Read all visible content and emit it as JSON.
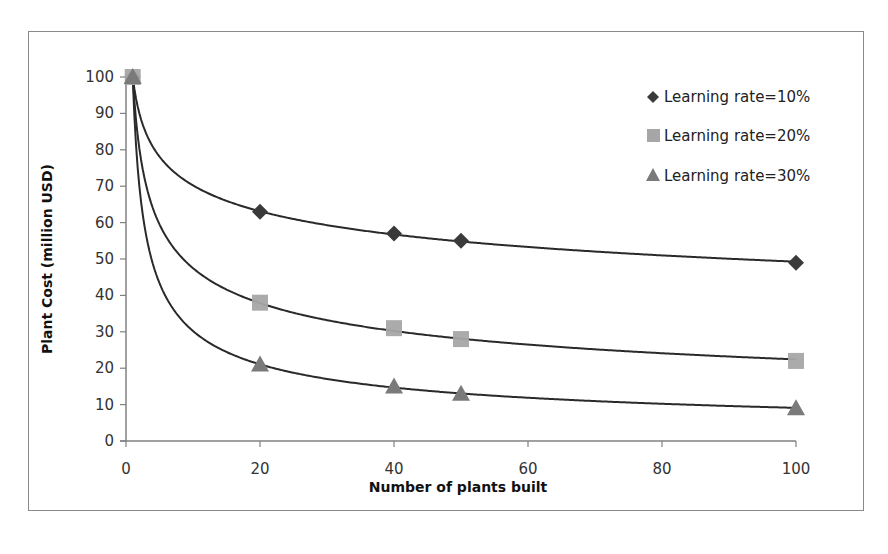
{
  "chart_data": {
    "type": "scatter",
    "title": "",
    "xlabel": "Number of plants built",
    "ylabel": "Plant Cost (million USD)",
    "xlim": [
      0,
      100
    ],
    "ylim": [
      0,
      100
    ],
    "xticks": [
      0,
      20,
      40,
      60,
      80,
      100
    ],
    "yticks": [
      0,
      10,
      20,
      30,
      40,
      50,
      60,
      70,
      80,
      90,
      100
    ],
    "grid": false,
    "legend_position": "upper right",
    "series": [
      {
        "name": "Learning rate=10%",
        "marker": "diamond",
        "color": "#3a3a3a",
        "trendline": "power",
        "x": [
          1,
          20,
          40,
          50,
          100
        ],
        "y": [
          100,
          63,
          57,
          55,
          49
        ]
      },
      {
        "name": "Learning rate=20%",
        "marker": "square",
        "color": "#a6a6a6",
        "trendline": "power",
        "x": [
          1,
          20,
          40,
          50,
          100
        ],
        "y": [
          100,
          38,
          31,
          28,
          22
        ]
      },
      {
        "name": "Learning rate=30%",
        "marker": "triangle",
        "color": "#7a7a7a",
        "trendline": "power",
        "x": [
          1,
          20,
          40,
          50,
          100
        ],
        "y": [
          100,
          21,
          15,
          13,
          9
        ]
      }
    ]
  },
  "axes": {
    "x_title": "Number of plants built",
    "y_title": "Plant Cost (million USD)",
    "x_tick_labels": [
      "0",
      "20",
      "40",
      "60",
      "80",
      "100"
    ],
    "y_tick_labels": [
      "0",
      "10",
      "20",
      "30",
      "40",
      "50",
      "60",
      "70",
      "80",
      "90",
      "100"
    ]
  },
  "legend": {
    "items": [
      {
        "label": "Learning rate=10%",
        "icon": "diamond-icon"
      },
      {
        "label": "Learning rate=20%",
        "icon": "square-icon"
      },
      {
        "label": "Learning rate=30%",
        "icon": "triangle-icon"
      }
    ]
  },
  "colors": {
    "frame": "#8a8a8a",
    "axis": "#808080",
    "trendline": "#2a2a2a"
  }
}
